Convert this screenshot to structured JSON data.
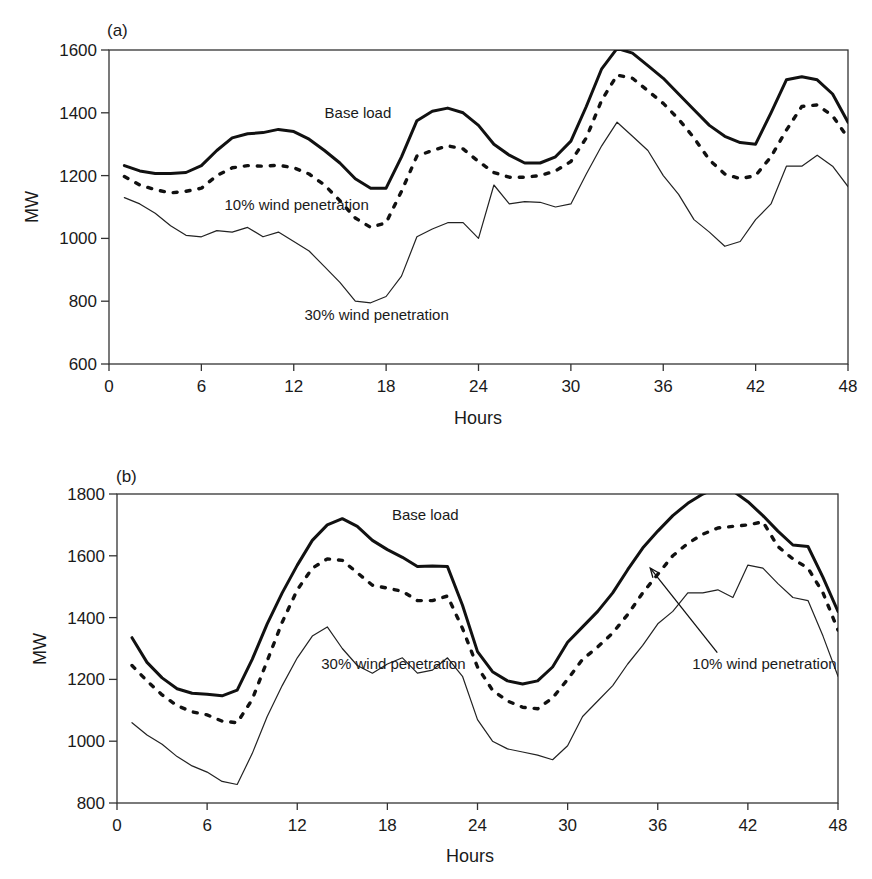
{
  "chart_data": [
    {
      "type": "line",
      "panel_label": "(a)",
      "title": "",
      "xlabel": "Hours",
      "ylabel": "MW",
      "xlim": [
        0,
        48
      ],
      "ylim": [
        600,
        1600
      ],
      "xticks": [
        0,
        6,
        12,
        18,
        24,
        30,
        36,
        42,
        48
      ],
      "yticks": [
        600,
        800,
        1000,
        1200,
        1400,
        1600
      ],
      "grid": false,
      "legend": "none (inline annotations)",
      "x": [
        1,
        2,
        3,
        4,
        5,
        6,
        7,
        8,
        9,
        10,
        11,
        12,
        13,
        14,
        15,
        16,
        17,
        18,
        19,
        20,
        21,
        22,
        23,
        24,
        25,
        26,
        27,
        28,
        29,
        30,
        31,
        32,
        33,
        34,
        35,
        36,
        37,
        38,
        39,
        40,
        41,
        42,
        43,
        44,
        45,
        46,
        47,
        48
      ],
      "series": [
        {
          "name": "Base load",
          "style": "thick solid",
          "values": [
            1232,
            1215,
            1207,
            1207,
            1210,
            1232,
            1280,
            1320,
            1333,
            1337,
            1347,
            1340,
            1316,
            1280,
            1240,
            1190,
            1160,
            1160,
            1260,
            1375,
            1405,
            1415,
            1400,
            1360,
            1300,
            1265,
            1240,
            1240,
            1260,
            1310,
            1420,
            1540,
            1605,
            1590,
            1550,
            1510,
            1460,
            1410,
            1360,
            1325,
            1305,
            1300,
            1400,
            1505,
            1515,
            1505,
            1460,
            1370
          ]
        },
        {
          "name": "10% wind penetration",
          "style": "thick dotted",
          "values": [
            1197,
            1170,
            1155,
            1145,
            1150,
            1160,
            1200,
            1225,
            1232,
            1230,
            1233,
            1225,
            1205,
            1170,
            1120,
            1065,
            1035,
            1050,
            1150,
            1262,
            1280,
            1295,
            1285,
            1245,
            1210,
            1195,
            1195,
            1200,
            1215,
            1245,
            1320,
            1440,
            1520,
            1510,
            1470,
            1430,
            1380,
            1320,
            1250,
            1205,
            1190,
            1200,
            1260,
            1345,
            1420,
            1425,
            1390,
            1320
          ]
        },
        {
          "name": "30% wind penetration",
          "style": "thin solid",
          "values": [
            1130,
            1110,
            1080,
            1040,
            1010,
            1005,
            1025,
            1020,
            1035,
            1005,
            1020,
            990,
            960,
            910,
            860,
            800,
            795,
            815,
            880,
            1005,
            1030,
            1050,
            1050,
            1000,
            1170,
            1110,
            1117,
            1115,
            1100,
            1110,
            1205,
            1295,
            1370,
            1325,
            1280,
            1200,
            1140,
            1060,
            1020,
            975,
            990,
            1060,
            1110,
            1230,
            1230,
            1265,
            1230,
            1165
          ]
        }
      ],
      "annotations": [
        {
          "text": "Base load",
          "x": 14,
          "y": 1385
        },
        {
          "text": "10% wind penetration",
          "x": 7.5,
          "y": 1090
        },
        {
          "text": "30% wind penetration",
          "x": 12.7,
          "y": 740
        }
      ]
    },
    {
      "type": "line",
      "panel_label": "(b)",
      "title": "",
      "xlabel": "Hours",
      "ylabel": "MW",
      "xlim": [
        0,
        48
      ],
      "ylim": [
        800,
        1800
      ],
      "xticks": [
        0,
        6,
        12,
        18,
        24,
        30,
        36,
        42,
        48
      ],
      "yticks": [
        800,
        1000,
        1200,
        1400,
        1600,
        1800
      ],
      "grid": false,
      "legend": "none (inline annotations)",
      "x": [
        1,
        2,
        3,
        4,
        5,
        6,
        7,
        8,
        9,
        10,
        11,
        12,
        13,
        14,
        15,
        16,
        17,
        18,
        19,
        20,
        21,
        22,
        23,
        24,
        25,
        26,
        27,
        28,
        29,
        30,
        31,
        32,
        33,
        34,
        35,
        36,
        37,
        38,
        39,
        40,
        41,
        42,
        43,
        44,
        45,
        46,
        47,
        48
      ],
      "series": [
        {
          "name": "Base load",
          "style": "thick solid",
          "values": [
            1335,
            1255,
            1205,
            1170,
            1155,
            1152,
            1147,
            1165,
            1265,
            1380,
            1480,
            1570,
            1650,
            1700,
            1720,
            1695,
            1650,
            1620,
            1595,
            1565,
            1567,
            1565,
            1440,
            1290,
            1225,
            1195,
            1185,
            1195,
            1240,
            1320,
            1370,
            1420,
            1480,
            1555,
            1625,
            1680,
            1730,
            1770,
            1800,
            1820,
            1810,
            1775,
            1730,
            1680,
            1635,
            1630,
            1530,
            1420
          ]
        },
        {
          "name": "10% wind penetration",
          "style": "thick dotted",
          "values": [
            1245,
            1195,
            1150,
            1115,
            1095,
            1085,
            1065,
            1060,
            1135,
            1260,
            1385,
            1490,
            1560,
            1590,
            1585,
            1545,
            1505,
            1495,
            1485,
            1455,
            1455,
            1470,
            1365,
            1240,
            1165,
            1130,
            1110,
            1105,
            1140,
            1200,
            1265,
            1305,
            1350,
            1410,
            1480,
            1540,
            1600,
            1640,
            1670,
            1690,
            1695,
            1700,
            1710,
            1630,
            1590,
            1560,
            1480,
            1360
          ]
        },
        {
          "name": "30% wind penetration",
          "style": "thin solid",
          "values": [
            1060,
            1020,
            990,
            950,
            920,
            900,
            870,
            860,
            960,
            1080,
            1180,
            1270,
            1340,
            1370,
            1300,
            1245,
            1220,
            1250,
            1270,
            1220,
            1230,
            1270,
            1210,
            1070,
            1000,
            975,
            965,
            955,
            940,
            985,
            1080,
            1130,
            1180,
            1250,
            1310,
            1380,
            1420,
            1480,
            1480,
            1490,
            1465,
            1570,
            1560,
            1510,
            1465,
            1455,
            1340,
            1210
          ]
        }
      ],
      "annotations": [
        {
          "text": "Base load",
          "x": 18.3,
          "y": 1715
        },
        {
          "text": "30% wind penetration",
          "x": 13.6,
          "y": 1235
        },
        {
          "text": "10% wind penetration",
          "x": 38.3,
          "y": 1235,
          "arrow_to": {
            "x": 35.5,
            "y": 1560
          }
        }
      ]
    }
  ]
}
